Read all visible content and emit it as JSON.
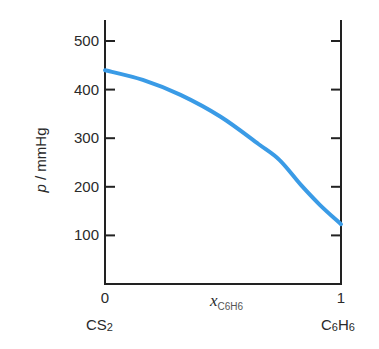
{
  "chart_data": {
    "type": "line",
    "title": "",
    "xlabel": "x",
    "xlabel_subscript": "C6H6",
    "ylabel_italic": "p",
    "ylabel_rest": " / mmHg",
    "xlim": [
      0,
      1
    ],
    "ylim": [
      0,
      540
    ],
    "grid": false,
    "legend": "none",
    "x_ticks": [
      {
        "value": 0,
        "label": "0"
      },
      {
        "value": 1,
        "label": "1"
      }
    ],
    "y_ticks": [
      {
        "value": 100,
        "label": "100"
      },
      {
        "value": 200,
        "label": "200"
      },
      {
        "value": 300,
        "label": "300"
      },
      {
        "value": 400,
        "label": "400"
      },
      {
        "value": 500,
        "label": "500"
      }
    ],
    "component_labels": {
      "left": {
        "main": "CS",
        "sub": "2"
      },
      "right": {
        "a": "C",
        "a_sub": "6",
        "b": "H",
        "b_sub": "6"
      }
    },
    "series": [
      {
        "name": "total vapour pressure",
        "color": "#3a9be6",
        "x": [
          0.0,
          0.16,
          0.32,
          0.49,
          0.65,
          0.74,
          0.83,
          0.91,
          1.0
        ],
        "y": [
          440,
          420,
          389,
          344,
          288,
          255,
          204,
          163,
          123
        ]
      }
    ]
  }
}
